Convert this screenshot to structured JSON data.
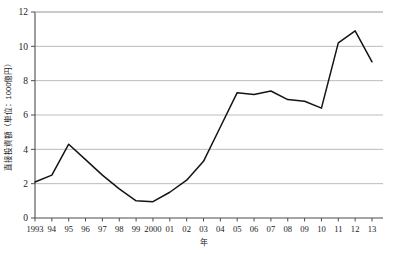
{
  "chart_data": {
    "type": "line",
    "title": "",
    "xlabel": "年",
    "ylabel": "直接投資額（単位：1000億円）",
    "x": [
      1993,
      1994,
      1995,
      1996,
      1997,
      1998,
      1999,
      2000,
      2001,
      2002,
      2003,
      2004,
      2005,
      2006,
      2007,
      2008,
      2009,
      2010,
      2011,
      2012,
      2013
    ],
    "categories": [
      "1993",
      "94",
      "95",
      "96",
      "97",
      "98",
      "99",
      "2000",
      "01",
      "02",
      "03",
      "04",
      "05",
      "06",
      "07",
      "08",
      "09",
      "10",
      "11",
      "12",
      "13"
    ],
    "values": [
      2.1,
      2.5,
      4.3,
      3.4,
      2.5,
      1.7,
      1.0,
      0.95,
      1.5,
      2.2,
      3.3,
      5.3,
      7.3,
      7.2,
      7.4,
      6.9,
      6.8,
      6.4,
      10.2,
      10.9,
      9.1
    ],
    "series": [
      {
        "name": "直接投資額",
        "color": "#141414",
        "values": [
          2.1,
          2.5,
          4.3,
          3.4,
          2.5,
          1.7,
          1.0,
          0.95,
          1.5,
          2.2,
          3.3,
          5.3,
          7.3,
          7.2,
          7.4,
          6.9,
          6.8,
          6.4,
          10.2,
          10.9,
          9.1
        ]
      }
    ],
    "ylim": [
      0,
      12
    ],
    "yticks": [
      0,
      2,
      4,
      6,
      8,
      10,
      12
    ],
    "ytick_labels": [
      "0",
      "2",
      "4",
      "6",
      "8",
      "10",
      "12"
    ],
    "grid": true,
    "grid_color": "#b4b4b4",
    "legend": false,
    "legend_position": "none",
    "line_width": 1.5,
    "markers": false,
    "axis_color": "#4d4d4d",
    "background": "#ffffff"
  }
}
